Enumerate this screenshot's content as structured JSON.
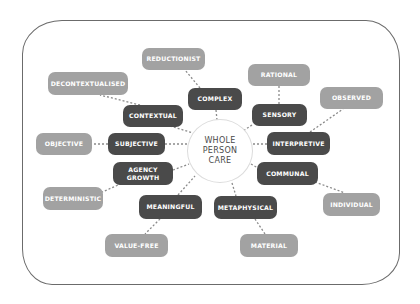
{
  "diagram": {
    "center": {
      "lines": [
        "WHOLE",
        "PERSON",
        "CARE"
      ]
    },
    "colors": {
      "dark_node": "#4a4a4a",
      "light_node": "#a2a2a2",
      "connector": "#8a8a8a",
      "frame": "#6b6b6b"
    },
    "pairs": [
      {
        "inner": "COMPLEX",
        "outer": "REDUCTIONIST"
      },
      {
        "inner": "CONTEXTUAL",
        "outer": "DECONTEXTUALISED"
      },
      {
        "inner": "SENSORY",
        "outer": "RATIONAL"
      },
      {
        "inner": "INTERPRETIVE",
        "outer": "OBSERVED"
      },
      {
        "inner": "SUBJECTIVE",
        "outer": "OBJECTIVE"
      },
      {
        "inner_lines": [
          "AGENCY",
          "GROWTH"
        ],
        "outer": "DETERMINISTIC"
      },
      {
        "inner": "COMMUNAL",
        "outer": "INDIVIDUAL"
      },
      {
        "inner": "MEANINGFUL",
        "outer": "VALUE-FREE"
      },
      {
        "inner": "METAPHYSICAL",
        "outer": "MATERIAL"
      }
    ]
  }
}
